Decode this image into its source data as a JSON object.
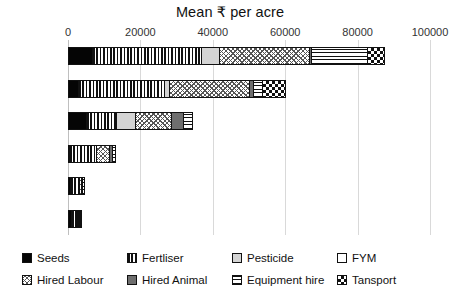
{
  "chart_data": {
    "type": "bar",
    "orientation": "horizontal",
    "stacked": true,
    "title": "Mean ₹ per acre",
    "xlabel": "",
    "ylabel": "",
    "xlim": [
      0,
      100000
    ],
    "xticks": [
      0,
      20000,
      40000,
      60000,
      80000,
      100000
    ],
    "xticklabels": [
      "0",
      "20000",
      "40000",
      "60000",
      "80000",
      "100000"
    ],
    "grid": true,
    "legend_position": "bottom",
    "categories": [
      "Mulberry",
      "Sugarcane",
      "Paddy",
      "Ragi",
      "Pulses",
      "Coconut"
    ],
    "series": [
      {
        "name": "Seeds",
        "key": "seeds",
        "values": [
          6900,
          3000,
          5200,
          600,
          900,
          1200
        ]
      },
      {
        "name": "Fertliser",
        "key": "fert",
        "values": [
          30400,
          24000,
          8600,
          7700,
          2500,
          1900
        ]
      },
      {
        "name": "Pesticide",
        "key": "pest",
        "values": [
          5200,
          1700,
          5500,
          0,
          300,
          200
        ]
      },
      {
        "name": "FYM",
        "key": "fym",
        "values": [
          0,
          0,
          0,
          0,
          0,
          0
        ]
      },
      {
        "name": "Hired Labour",
        "key": "hlab",
        "values": [
          25100,
          22400,
          10200,
          3900,
          700,
          500
        ]
      },
      {
        "name": "Hired Animal",
        "key": "hani",
        "values": [
          900,
          1400,
          3600,
          1100,
          400,
          300
        ]
      },
      {
        "name": "Equipment hire",
        "key": "equip",
        "values": [
          15700,
          2800,
          2800,
          1100,
          900,
          600
        ]
      },
      {
        "name": "Tansport",
        "key": "trans",
        "values": [
          5000,
          6600,
          0,
          0,
          0,
          0
        ]
      }
    ],
    "totals": [
      89200,
      61900,
      35900,
      14400,
      5700,
      4700
    ]
  },
  "legend": {
    "items": [
      {
        "label": "Seeds",
        "pattern": "solid-black"
      },
      {
        "label": "Fertliser",
        "pattern": "vertical-lines"
      },
      {
        "label": "Pesticide",
        "pattern": "light-gray"
      },
      {
        "label": "FYM",
        "pattern": "white"
      },
      {
        "label": "Hired Labour",
        "pattern": "cross-hatch"
      },
      {
        "label": "Hired Animal",
        "pattern": "mid-gray"
      },
      {
        "label": "Equipment hire",
        "pattern": "horizontal-lines"
      },
      {
        "label": "Tansport",
        "pattern": "checkerboard"
      }
    ]
  }
}
